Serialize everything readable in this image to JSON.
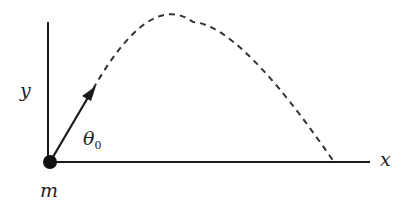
{
  "diagram": {
    "type": "projectile-motion",
    "labels": {
      "y_axis": "y",
      "x_axis": "x",
      "mass": "m",
      "angle": "θ",
      "angle_subscript": "0"
    },
    "colors": {
      "stroke": "#1a1a1a",
      "background": "#ffffff"
    },
    "elements": {
      "origin": [
        50,
        162
      ],
      "y_axis_top": [
        47,
        22
      ],
      "x_axis_end": [
        370,
        161
      ],
      "velocity_arrow_tip": [
        93,
        89
      ],
      "trajectory_peak": [
        193,
        22
      ],
      "trajectory_landing": [
        334,
        161
      ],
      "trajectory_style": "dashed"
    }
  }
}
